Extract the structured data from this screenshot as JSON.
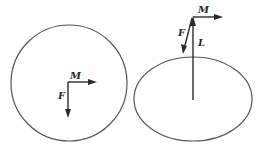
{
  "figures": [
    {
      "name": "disk-top-view",
      "shape": "circle",
      "labels": {
        "moment": "M",
        "force": "F"
      }
    },
    {
      "name": "disk-oblique-view",
      "shape": "ellipse",
      "labels": {
        "moment": "M",
        "force": "F",
        "length": "L"
      }
    }
  ],
  "colors": {
    "outline": "#555555",
    "vector": "#2a2a2a",
    "background": "#ffffff"
  }
}
